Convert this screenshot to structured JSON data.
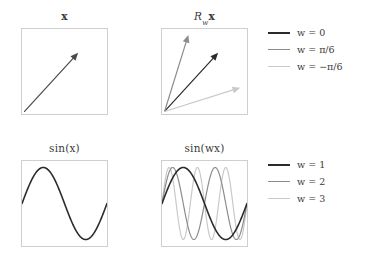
{
  "figure": {
    "background": "#ffffff",
    "panel_border_color": "#cfcfcf",
    "colors": {
      "dark": "#2b2b2b",
      "medium": "#8c8c8c",
      "light": "#c9c9c9"
    }
  },
  "panels": {
    "vector": {
      "title_prefix": "",
      "title": "x",
      "name": "x"
    },
    "rotated_vector": {
      "title_base": "R",
      "title_sub": "w",
      "title_suffix": "x",
      "title": "Rᵥx",
      "name": "Rwx"
    },
    "sine": {
      "title": "sin(x)",
      "name": "sin(x)"
    },
    "sine_w": {
      "title": "sin(wx)",
      "name": "sin(wx)"
    }
  },
  "legends": {
    "top": {
      "items": [
        {
          "label": "w = 0",
          "color": "#2b2b2b",
          "width": 2.2
        },
        {
          "label": "w = π/6",
          "color": "#8c8c8c",
          "width": 1.4
        },
        {
          "label": "w = −π/6",
          "color": "#c9c9c9",
          "width": 1.2
        }
      ]
    },
    "bottom": {
      "items": [
        {
          "label": "w = 1",
          "color": "#2b2b2b",
          "width": 2.2
        },
        {
          "label": "w = 2",
          "color": "#8c8c8c",
          "width": 1.4
        },
        {
          "label": "w = 3",
          "color": "#c9c9c9",
          "width": 1.2
        }
      ]
    }
  },
  "chart_data": [
    {
      "type": "quiver",
      "title": "x",
      "panel": "vector",
      "xlim": [
        0,
        1
      ],
      "ylim": [
        0,
        1
      ],
      "grid": false,
      "axis_ticks": false,
      "vectors": [
        {
          "name": "w = 0",
          "origin": [
            0.03,
            0.03
          ],
          "tip": [
            0.66,
            0.72
          ],
          "angle_deg": 47.5,
          "color": "#4a4a4a"
        }
      ]
    },
    {
      "type": "quiver",
      "title": "R_w x",
      "panel": "rotated_vector",
      "xlim": [
        0,
        1
      ],
      "ylim": [
        0,
        1
      ],
      "grid": false,
      "axis_ticks": false,
      "vectors": [
        {
          "name": "w = 0",
          "origin": [
            0.03,
            0.03
          ],
          "tip": [
            0.66,
            0.72
          ],
          "angle_deg": 47.5,
          "color": "#2b2b2b"
        },
        {
          "name": "w = pi/6",
          "origin": [
            0.03,
            0.03
          ],
          "tip": [
            0.31,
            0.93
          ],
          "angle_deg": 77.5,
          "color": "#8c8c8c"
        },
        {
          "name": "w = -pi/6",
          "origin": [
            0.03,
            0.03
          ],
          "tip": [
            0.92,
            0.31
          ],
          "angle_deg": 17.5,
          "color": "#c9c9c9"
        }
      ]
    },
    {
      "type": "line",
      "title": "sin(x)",
      "panel": "sine",
      "xlabel": "",
      "ylabel": "",
      "xlim": [
        0,
        6.283185
      ],
      "ylim": [
        -1.18,
        1.18
      ],
      "grid": false,
      "axis_ticks": false,
      "series": [
        {
          "name": "w = 1",
          "function": "sin(1*x)",
          "frequency": 1,
          "amplitude": 1,
          "color": "#2b2b2b",
          "width": 1.6
        }
      ]
    },
    {
      "type": "line",
      "title": "sin(wx)",
      "panel": "sine_w",
      "xlabel": "",
      "ylabel": "",
      "xlim": [
        0,
        6.283185
      ],
      "ylim": [
        -1.18,
        1.18
      ],
      "grid": false,
      "axis_ticks": false,
      "series": [
        {
          "name": "w = 1",
          "function": "sin(1*x)",
          "frequency": 1,
          "amplitude": 1,
          "color": "#2b2b2b",
          "width": 1.6
        },
        {
          "name": "w = 2",
          "function": "sin(2*x)",
          "frequency": 2,
          "amplitude": 1,
          "color": "#8c8c8c",
          "width": 1.2
        },
        {
          "name": "w = 3",
          "function": "sin(3*x)",
          "frequency": 3,
          "amplitude": 1,
          "color": "#c9c9c9",
          "width": 1.2
        }
      ]
    }
  ]
}
